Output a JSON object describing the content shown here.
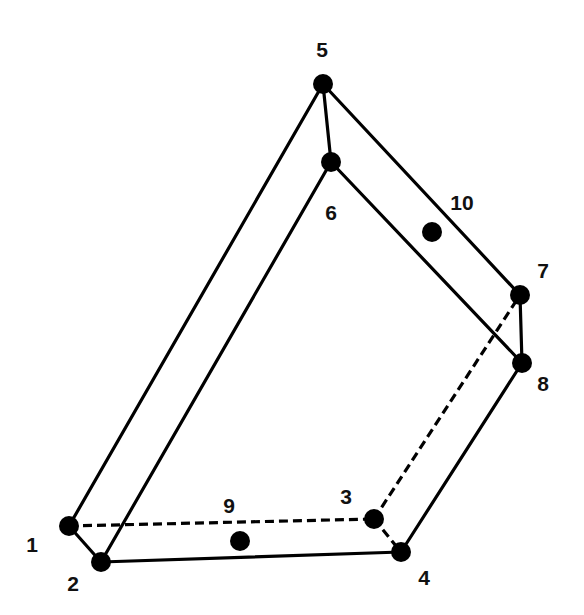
{
  "diagram": {
    "type": "hexahedral element node numbering",
    "nodes": [
      {
        "id": "1",
        "label": "1",
        "x": 69,
        "y": 526,
        "lx": 32,
        "ly": 544
      },
      {
        "id": "2",
        "label": "2",
        "x": 101,
        "y": 562,
        "lx": 73,
        "ly": 583
      },
      {
        "id": "3",
        "label": "3",
        "x": 374,
        "y": 519,
        "lx": 346,
        "ly": 496
      },
      {
        "id": "4",
        "label": "4",
        "x": 401,
        "y": 552,
        "lx": 424,
        "ly": 577
      },
      {
        "id": "5",
        "label": "5",
        "x": 323,
        "y": 84,
        "lx": 322,
        "ly": 49
      },
      {
        "id": "6",
        "label": "6",
        "x": 331,
        "y": 162,
        "lx": 331,
        "ly": 212
      },
      {
        "id": "7",
        "label": "7",
        "x": 520,
        "y": 295,
        "lx": 543,
        "ly": 270
      },
      {
        "id": "8",
        "label": "8",
        "x": 522,
        "y": 363,
        "lx": 543,
        "ly": 383
      },
      {
        "id": "9",
        "label": "9",
        "x": 240,
        "y": 541,
        "lx": 229,
        "ly": 505
      },
      {
        "id": "10",
        "label": "10",
        "x": 432,
        "y": 232,
        "lx": 462,
        "ly": 202
      }
    ],
    "edges": [
      {
        "from": "1",
        "to": "2",
        "style": "solid"
      },
      {
        "from": "2",
        "to": "4",
        "style": "solid"
      },
      {
        "from": "1",
        "to": "5",
        "style": "solid"
      },
      {
        "from": "2",
        "to": "6",
        "style": "solid"
      },
      {
        "from": "5",
        "to": "6",
        "style": "solid"
      },
      {
        "from": "5",
        "to": "7",
        "style": "solid"
      },
      {
        "from": "6",
        "to": "8",
        "style": "solid"
      },
      {
        "from": "7",
        "to": "8",
        "style": "solid"
      },
      {
        "from": "8",
        "to": "4",
        "style": "solid"
      },
      {
        "from": "1",
        "to": "3",
        "style": "dashed"
      },
      {
        "from": "3",
        "to": "4",
        "style": "dashed"
      },
      {
        "from": "3",
        "to": "7",
        "style": "dashed"
      }
    ],
    "node_radius": 10,
    "colors": {
      "stroke": "#000000",
      "node": "#000000",
      "background": "#ffffff"
    }
  }
}
